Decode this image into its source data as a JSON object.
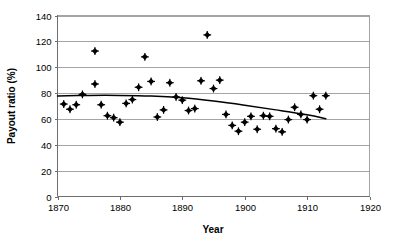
{
  "chart_data": {
    "type": "scatter",
    "title": "",
    "xlabel": "Year",
    "ylabel": "Payout ratio (%)",
    "xlim": [
      1870,
      1920
    ],
    "ylim": [
      0,
      140
    ],
    "xticks": [
      1870,
      1880,
      1890,
      1900,
      1910,
      1920
    ],
    "xtick_labels": [
      "1870",
      "1880",
      "1890",
      "1900",
      "1910",
      "1920"
    ],
    "yticks": [
      0,
      20,
      40,
      60,
      80,
      100,
      120,
      140
    ],
    "ytick_labels": [
      "0",
      "20",
      "40",
      "60",
      "80",
      "100",
      "120",
      "140"
    ],
    "grid": "horizontal",
    "legend": "none",
    "marker_style": "filled-diamond",
    "marker_color": "#000000",
    "series": [
      {
        "name": "Payout ratio",
        "type": "scatter",
        "points": [
          [
            1871,
            71.5
          ],
          [
            1872,
            67.5
          ],
          [
            1873,
            71.0
          ],
          [
            1874,
            79.0
          ],
          [
            1876,
            112.5
          ],
          [
            1876,
            87.0
          ],
          [
            1877,
            71.0
          ],
          [
            1878,
            62.5
          ],
          [
            1879,
            61.0
          ],
          [
            1880,
            57.5
          ],
          [
            1881,
            72.0
          ],
          [
            1882,
            75.0
          ],
          [
            1883,
            84.5
          ],
          [
            1884,
            108.0
          ],
          [
            1885,
            89.0
          ],
          [
            1886,
            61.5
          ],
          [
            1887,
            67.0
          ],
          [
            1888,
            88.0
          ],
          [
            1889,
            77.0
          ],
          [
            1890,
            74.5
          ],
          [
            1891,
            66.5
          ],
          [
            1892,
            68.0
          ],
          [
            1893,
            89.5
          ],
          [
            1894,
            125.0
          ],
          [
            1895,
            83.5
          ],
          [
            1896,
            90.0
          ],
          [
            1897,
            63.5
          ],
          [
            1898,
            55.0
          ],
          [
            1899,
            50.5
          ],
          [
            1900,
            57.5
          ],
          [
            1901,
            62.0
          ],
          [
            1902,
            52.0
          ],
          [
            1903,
            62.5
          ],
          [
            1904,
            62.0
          ],
          [
            1905,
            52.5
          ],
          [
            1906,
            50.0
          ],
          [
            1907,
            59.5
          ],
          [
            1908,
            69.0
          ],
          [
            1909,
            63.5
          ],
          [
            1910,
            59.5
          ],
          [
            1911,
            78.0
          ],
          [
            1912,
            67.5
          ],
          [
            1913,
            78.0
          ]
        ]
      },
      {
        "name": "Trend line",
        "type": "line",
        "points": [
          [
            1870,
            77.8
          ],
          [
            1875,
            78.2
          ],
          [
            1880,
            78.2
          ],
          [
            1885,
            77.7
          ],
          [
            1890,
            76.3
          ],
          [
            1895,
            73.8
          ],
          [
            1900,
            70.6
          ],
          [
            1905,
            67.0
          ],
          [
            1910,
            63.2
          ],
          [
            1913,
            60.2
          ]
        ]
      }
    ]
  }
}
